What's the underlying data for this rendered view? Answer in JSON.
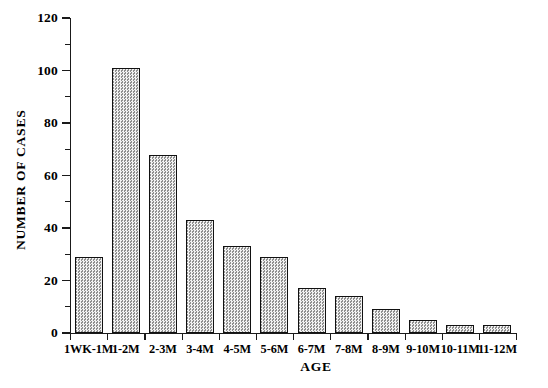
{
  "chart_data": {
    "type": "bar",
    "title": "",
    "xlabel": "AGE",
    "ylabel": "NUMBER OF CASES",
    "categories": [
      "1WK-1M",
      "1-2M",
      "2-3M",
      "3-4M",
      "4-5M",
      "5-6M",
      "6-7M",
      "7-8M",
      "8-9M",
      "9-10M",
      "10-11M",
      "11-12M"
    ],
    "values": [
      29,
      101,
      68,
      43,
      33,
      29,
      17,
      14,
      9,
      5,
      3,
      3
    ],
    "ylim": [
      0,
      120
    ],
    "yticks": [
      0,
      20,
      40,
      60,
      80,
      100,
      120
    ],
    "ytick_labels": [
      "0",
      "20",
      "40",
      "60",
      "80",
      "100",
      "120"
    ],
    "yminor_ticks": [
      10,
      30,
      50,
      70,
      90,
      110
    ],
    "grid": false,
    "legend": false,
    "bar_fill": "#d9d9d9",
    "bar_edge": "#111111",
    "axis_color": "#1a1a1a",
    "background": "#ffffff"
  }
}
